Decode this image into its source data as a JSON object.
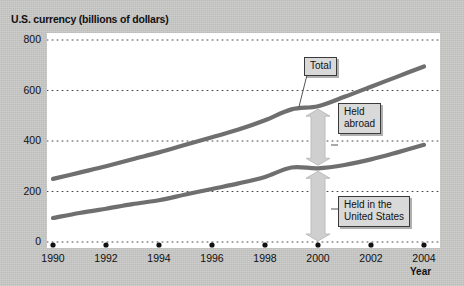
{
  "chart_data": {
    "type": "line",
    "title": "U.S. currency (billions of dollars)",
    "xlabel": "Year",
    "ylabel": "",
    "xlim": [
      1990,
      2004
    ],
    "ylim": [
      0,
      800
    ],
    "yticks": [
      0,
      200,
      400,
      600,
      800
    ],
    "xticks": [
      1990,
      1992,
      1994,
      1996,
      1998,
      2000,
      2002,
      2004
    ],
    "xtick_labels": [
      "1990",
      "1992",
      "1994",
      "1996",
      "1998",
      "2000",
      "2002",
      "2004"
    ],
    "ytick_labels": [
      "0",
      "200",
      "400",
      "600",
      "800"
    ],
    "grid": "horizontal-dotted",
    "legend": "none",
    "line_color": "#6f6f6f",
    "x": [
      1990,
      1991,
      1992,
      1993,
      1994,
      1995,
      1996,
      1997,
      1998,
      1999,
      2000,
      2001,
      2002,
      2003,
      2004
    ],
    "series": [
      {
        "name": "Total",
        "values": [
          250,
          275,
          300,
          328,
          355,
          385,
          415,
          445,
          482,
          525,
          538,
          575,
          615,
          655,
          695
        ]
      },
      {
        "name": "Held in the United States",
        "values": [
          95,
          115,
          132,
          150,
          165,
          188,
          210,
          232,
          258,
          295,
          292,
          305,
          327,
          355,
          385
        ]
      }
    ],
    "annotations": [
      {
        "label": "Total",
        "points_to_series": "Total",
        "points_to_year": 2000
      },
      {
        "label": "Held\nabroad",
        "meaning": "gap between Total and Held in the United States"
      },
      {
        "label": "Held in the\nUnited States",
        "meaning": "area under lower curve"
      }
    ]
  },
  "callouts": {
    "total": "Total",
    "held_abroad_line1": "Held",
    "held_abroad_line2": "abroad",
    "held_us_line1": "Held in the",
    "held_us_line2": "United States"
  },
  "axis": {
    "year_label": "Year"
  }
}
